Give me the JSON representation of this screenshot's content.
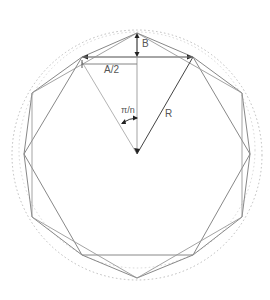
{
  "diagram": {
    "labels": {
      "b": "B",
      "half_side": "A/2",
      "angle": "π/n",
      "radius": "R"
    },
    "geometry": {
      "center": [
        137,
        154
      ],
      "radius": 122,
      "circle_radius": 126,
      "polygon_sides": [
        12,
        6,
        6
      ]
    },
    "colors": {
      "line": "#888888",
      "dotted_circle": "#bbbbbb",
      "marker": "#222222",
      "text": "#555555"
    }
  }
}
